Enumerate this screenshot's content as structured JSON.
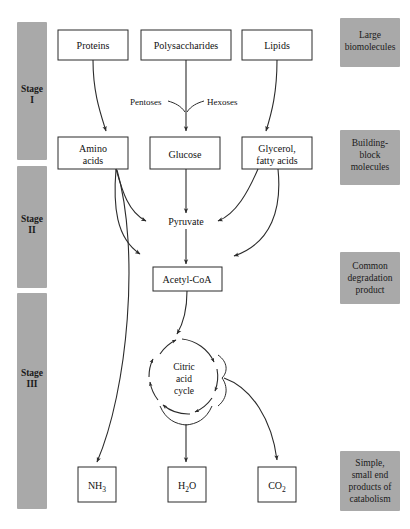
{
  "diagram": {
    "colors": {
      "band_gray": "#a9a9a9",
      "stroke": "#2b2b2b",
      "background": "#ffffff"
    },
    "stages": [
      {
        "id": "stage-1",
        "line1": "Stage",
        "line2": "I"
      },
      {
        "id": "stage-2",
        "line1": "Stage",
        "line2": "II"
      },
      {
        "id": "stage-3",
        "line1": "Stage",
        "line2": "III"
      }
    ],
    "side_labels": [
      {
        "id": "large-biomolecules",
        "lines": [
          "Large",
          "biomolecules"
        ]
      },
      {
        "id": "building-block-molecules",
        "lines": [
          "Building-",
          "block",
          "molecules"
        ]
      },
      {
        "id": "common-degradation-product",
        "lines": [
          "Common",
          "degradation",
          "product"
        ]
      },
      {
        "id": "end-products",
        "lines": [
          "Simple,",
          "small end",
          "products of",
          "catabolism"
        ]
      }
    ],
    "row1": [
      {
        "id": "proteins",
        "label": "Proteins"
      },
      {
        "id": "polysaccharides",
        "label": "Polysaccharides"
      },
      {
        "id": "lipids",
        "label": "Lipids"
      }
    ],
    "row2": [
      {
        "id": "amino-acids",
        "line1": "Amino",
        "line2": "acids"
      },
      {
        "id": "glucose",
        "line1": "Glucose",
        "line2": ""
      },
      {
        "id": "glycerol-fatty-acids",
        "line1": "Glycerol,",
        "line2": "fatty acids"
      }
    ],
    "sugar_labels": {
      "pentoses": "Pentoses",
      "hexoses": "Hexoses"
    },
    "intermediates": {
      "pyruvate": "Pyruvate",
      "acetyl_coa": "Acetyl-CoA"
    },
    "cycle": {
      "id": "citric-acid-cycle",
      "line1": "Citric",
      "line2": "acid",
      "line3": "cycle"
    },
    "products": [
      {
        "id": "ammonia",
        "base": "NH",
        "sub": "3"
      },
      {
        "id": "water",
        "base": "H",
        "sub": "2",
        "tail": "O"
      },
      {
        "id": "carbon-dioxide",
        "base": "CO",
        "sub": "2"
      }
    ]
  }
}
